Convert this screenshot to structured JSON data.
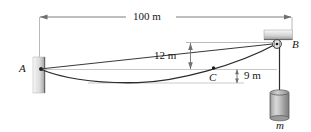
{
  "figure": {
    "type": "statics-cable-diagram",
    "background_color": "#ffffff",
    "line_color": "#2b2b2b",
    "dim_line_color": "#8a8a8a",
    "hatch_fill_light": "#f2f2f2",
    "hatch_fill_dark": "#9a9a9a"
  },
  "labels": {
    "span": "100 m",
    "sag_upper": "12 m",
    "sag_lower": "9 m",
    "point_a": "A",
    "point_b": "B",
    "point_c": "C",
    "mass": "m"
  },
  "geometry": {
    "span_m": 100,
    "height_b_above_a_m": 12,
    "depth_c_below_a_m": 9,
    "support_a": {
      "x": 40,
      "y": 69
    },
    "support_b": {
      "x": 277,
      "y": 43
    },
    "point_c": {
      "x": 213,
      "y": 68
    },
    "curve_lowest": {
      "x": 135,
      "y": 83
    }
  },
  "elements": [
    {
      "name": "wall-support-a",
      "kind": "hatched-block",
      "orientation": "vertical"
    },
    {
      "name": "ceiling-support-b",
      "kind": "hatched-block",
      "orientation": "horizontal"
    },
    {
      "name": "pulley-b",
      "kind": "circle-with-center-dot"
    },
    {
      "name": "cable-curve",
      "kind": "catenary"
    },
    {
      "name": "chord-line",
      "kind": "straight-line"
    },
    {
      "name": "hanging-cord",
      "kind": "vertical-line"
    },
    {
      "name": "mass-cylinder",
      "kind": "cylinder"
    },
    {
      "name": "dimension-100m",
      "kind": "horizontal-dimension"
    },
    {
      "name": "dimension-12m",
      "kind": "vertical-dimension"
    },
    {
      "name": "dimension-9m",
      "kind": "vertical-dimension"
    }
  ]
}
